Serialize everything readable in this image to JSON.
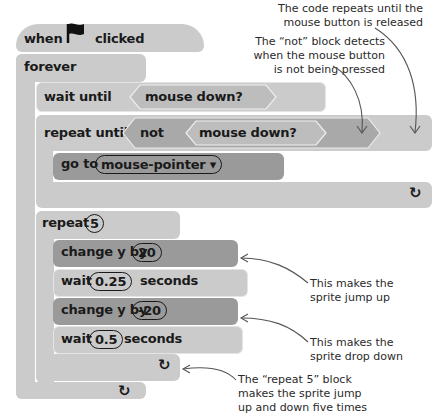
{
  "script": {
    "hat": {
      "when": "when",
      "icon": "green-flag-icon",
      "clicked": "clicked"
    },
    "forever": {
      "label": "forever"
    },
    "wait_until": {
      "label": "wait until",
      "condition": "mouse down?"
    },
    "repeat_until": {
      "label": "repeat until",
      "not": "not",
      "condition": "mouse down?"
    },
    "go_to": {
      "label": "go to",
      "target": "mouse-pointer ▾"
    },
    "repeat": {
      "label": "repeat",
      "count": "5"
    },
    "change_y_up": {
      "label": "change y by",
      "value": "20"
    },
    "wait_up": {
      "label": "wait",
      "value": "0.25",
      "unit": "seconds"
    },
    "change_y_down": {
      "label": "change y by",
      "value": "-20"
    },
    "wait_down": {
      "label": "wait",
      "value": "0.5",
      "unit": "seconds"
    },
    "loop_arrow": "↻"
  },
  "annotations": {
    "repeat_until": [
      "The code repeats until the",
      "mouse button is released"
    ],
    "not_block": [
      "The “not” block detects",
      "when the mouse button",
      "is not being pressed"
    ],
    "jump_up": [
      "This makes the",
      "sprite jump up"
    ],
    "drop_down": [
      "This makes the",
      "sprite drop down"
    ],
    "repeat5": [
      "The “repeat 5” block",
      "makes the sprite jump",
      "up and down five times"
    ]
  },
  "colors": {
    "light_block": "#cbcbcb",
    "dark_block": "#9a9a9a",
    "text": "#1a1a1a",
    "annotation": "#2a2a2a"
  }
}
